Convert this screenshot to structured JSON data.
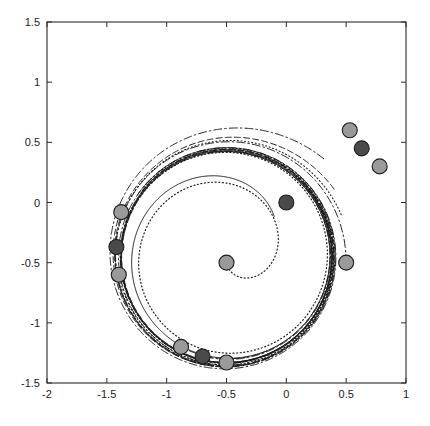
{
  "figure": {
    "title": "",
    "background_color": "#ffffff",
    "width": 430,
    "height": 426
  },
  "chart_data": {
    "type": "line",
    "title": "",
    "xlabel": "",
    "ylabel": "",
    "xlim": [
      -2,
      1
    ],
    "ylim": [
      -1.5,
      1.5
    ],
    "grid": false,
    "legend": null,
    "axis": {
      "x_ticks": [
        -2,
        -1.5,
        -1,
        -0.5,
        0,
        0.5,
        1
      ],
      "x_tick_labels": [
        "-2",
        "-1.5",
        "-1",
        "-0.5",
        "0",
        "0.5",
        "1"
      ],
      "y_ticks": [
        -1.5,
        -1,
        -0.5,
        0,
        0.5,
        1,
        1.5
      ],
      "y_tick_labels": [
        "-1.5",
        "-1",
        "-0.5",
        "0",
        "0.5",
        "1",
        "1.5"
      ],
      "box": true,
      "tick_direction": "in"
    },
    "limit_cycle": {
      "center": [
        -0.5,
        -0.45
      ],
      "radius": 0.88,
      "style": "solid"
    },
    "series": [
      {
        "name": "trajectory-1",
        "style": "solid",
        "stroke_width": 1.0,
        "start": [
          0,
          0
        ],
        "center": [
          -0.5,
          -0.45
        ],
        "r_start": 0.52,
        "r_end": 0.88,
        "theta_start": 40,
        "theta_sweep": 420
      },
      {
        "name": "trajectory-2",
        "style": "dotted",
        "stroke_width": 1.2,
        "start": [
          -0.5,
          -0.5
        ],
        "center": [
          -0.5,
          -0.45
        ],
        "r_start": 0.05,
        "r_end": 0.9,
        "theta_start": 270,
        "theta_sweep": 700
      },
      {
        "name": "trajectory-3",
        "style": "dashdot",
        "stroke_width": 1.0,
        "start": [
          0.5,
          -0.5
        ],
        "center": [
          -0.5,
          -0.45
        ],
        "r_start": 1.0,
        "r_end": 0.9,
        "theta_start": 357,
        "theta_sweep": 640
      },
      {
        "name": "trajectory-4",
        "style": "dashed",
        "stroke_width": 1.0,
        "start": [
          -1.38,
          -0.08
        ],
        "center": [
          -0.5,
          -0.45
        ],
        "r_start": 0.96,
        "r_end": 0.88,
        "theta_start": 157,
        "theta_sweep": 560
      },
      {
        "name": "trajectory-5",
        "style": "dashdot",
        "stroke_width": 1.0,
        "start": [
          -1.42,
          -0.3
        ],
        "center": [
          -0.5,
          -0.45
        ],
        "r_start": 0.93,
        "r_end": 0.885,
        "theta_start": 170,
        "theta_sweep": 600
      },
      {
        "name": "trajectory-6",
        "style": "dotted",
        "stroke_width": 1.1,
        "start": [
          -1.4,
          -0.6
        ],
        "center": [
          -0.5,
          -0.45
        ],
        "r_start": 0.91,
        "r_end": 0.885,
        "theta_start": 190,
        "theta_sweep": 600
      },
      {
        "name": "trajectory-7",
        "style": "dashed",
        "stroke_width": 1.0,
        "start": [
          -0.88,
          -1.2
        ],
        "center": [
          -0.5,
          -0.45
        ],
        "r_start": 0.84,
        "r_end": 0.88,
        "theta_start": 243,
        "theta_sweep": 520
      },
      {
        "name": "trajectory-8",
        "style": "dashdot",
        "stroke_width": 1.0,
        "start": [
          -0.68,
          -1.28
        ],
        "center": [
          -0.5,
          -0.45
        ],
        "r_start": 0.85,
        "r_end": 0.885,
        "theta_start": 258,
        "theta_sweep": 500
      },
      {
        "name": "trajectory-9",
        "style": "solid",
        "stroke_width": 1.0,
        "start": [
          -0.5,
          -1.33
        ],
        "center": [
          -0.5,
          -0.45
        ],
        "r_start": 0.88,
        "r_end": 0.88,
        "theta_start": 270,
        "theta_sweep": 500
      },
      {
        "name": "trajectory-10",
        "style": "dashdot",
        "stroke_width": 1.0,
        "start": [
          0.53,
          0.6
        ],
        "center": [
          -0.5,
          -0.45
        ],
        "r_start": 1.15,
        "r_end": 0.9,
        "theta_start": 45,
        "theta_sweep": 460
      },
      {
        "name": "trajectory-11",
        "style": "dashed",
        "stroke_width": 1.0,
        "start": [
          0.62,
          0.45
        ],
        "center": [
          -0.5,
          -0.45
        ],
        "r_start": 1.06,
        "r_end": 0.89,
        "theta_start": 32,
        "theta_sweep": 470
      },
      {
        "name": "trajectory-12",
        "style": "dotted",
        "stroke_width": 1.1,
        "start": [
          0.78,
          0.3
        ],
        "center": [
          -0.5,
          -0.45
        ],
        "r_start": 1.02,
        "r_end": 0.9,
        "theta_start": 20,
        "theta_sweep": 480
      }
    ],
    "markers": [
      {
        "name": "marker-origin",
        "x": 0.0,
        "y": 0.0,
        "shade": "dark"
      },
      {
        "name": "marker-center-left",
        "x": -0.5,
        "y": -0.5,
        "shade": "light"
      },
      {
        "name": "marker-center-right",
        "x": 0.5,
        "y": -0.5,
        "shade": "light"
      },
      {
        "name": "marker-ur-1",
        "x": 0.53,
        "y": 0.6,
        "shade": "light"
      },
      {
        "name": "marker-ur-2",
        "x": 0.63,
        "y": 0.45,
        "shade": "dark"
      },
      {
        "name": "marker-ur-3",
        "x": 0.78,
        "y": 0.3,
        "shade": "light"
      },
      {
        "name": "marker-left-1",
        "x": -1.38,
        "y": -0.08,
        "shade": "light"
      },
      {
        "name": "marker-left-2",
        "x": -1.42,
        "y": -0.37,
        "shade": "dark"
      },
      {
        "name": "marker-left-3",
        "x": -1.4,
        "y": -0.6,
        "shade": "light"
      },
      {
        "name": "marker-bottom-1",
        "x": -0.88,
        "y": -1.2,
        "shade": "light"
      },
      {
        "name": "marker-bottom-2",
        "x": -0.7,
        "y": -1.28,
        "shade": "dark"
      },
      {
        "name": "marker-bottom-3",
        "x": -0.5,
        "y": -1.33,
        "shade": "light"
      }
    ],
    "marker_style": {
      "shape": "circle",
      "radius_px": 7.5,
      "light_fill": "#9a9a9a",
      "dark_fill": "#4a4a4a",
      "edge_color": "#1c1c1c"
    },
    "line_color": "#1c1c1c"
  }
}
